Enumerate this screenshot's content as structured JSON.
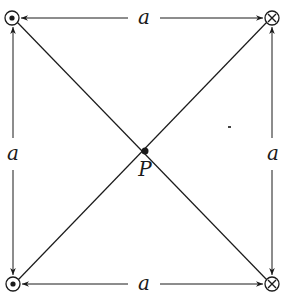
{
  "diagram": {
    "labels": {
      "top": "a",
      "bottom": "a",
      "left": "a",
      "right": "a",
      "center": "P"
    },
    "corners": [
      {
        "position": "top-left",
        "symbol": "dot",
        "meaning": "current out of page"
      },
      {
        "position": "top-right",
        "symbol": "cross",
        "meaning": "current into page"
      },
      {
        "position": "bottom-left",
        "symbol": "dot",
        "meaning": "current out of page"
      },
      {
        "position": "bottom-right",
        "symbol": "cross",
        "meaning": "current into page"
      }
    ],
    "colors": {
      "stroke": "#1a1a1a",
      "background": "#ffffff"
    }
  }
}
